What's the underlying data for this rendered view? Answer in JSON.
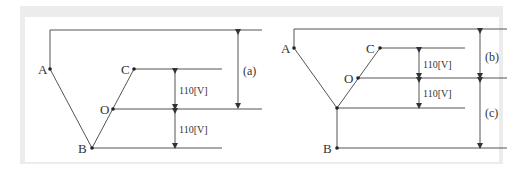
{
  "diagram": {
    "left": {
      "points": {
        "A": "A",
        "B": "B",
        "C": "C",
        "O": "O"
      },
      "voltage_upper": "110[V]",
      "voltage_lower": "110[V]",
      "measure": "(a)"
    },
    "right": {
      "points": {
        "A": "A",
        "B": "B",
        "C": "C",
        "O": "O"
      },
      "voltage_upper": "110[V]",
      "voltage_lower": "110[V]",
      "measure_upper": "(b)",
      "measure_lower": "(c)"
    }
  }
}
